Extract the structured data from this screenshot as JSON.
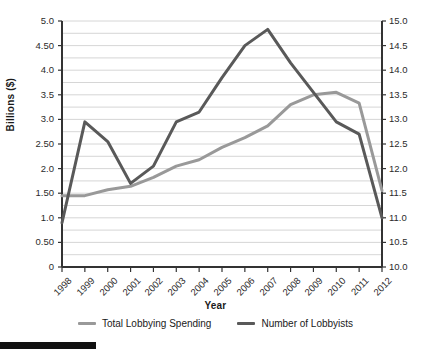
{
  "chart_data": {
    "type": "line",
    "title": "",
    "xlabel": "Year",
    "ylabel": "Billions ($)",
    "ylabel_secondary": "Number in Thousands",
    "categories": [
      "1998",
      "1999",
      "2000",
      "2001",
      "2002",
      "2003",
      "2004",
      "2005",
      "2006",
      "2007",
      "2008",
      "2009",
      "2010",
      "2011",
      "2012"
    ],
    "x": [
      1998,
      1999,
      2000,
      2001,
      2002,
      2003,
      2004,
      2005,
      2006,
      2007,
      2008,
      2009,
      2010,
      2011,
      2012
    ],
    "grid": true,
    "legend_position": "bottom",
    "ylim": [
      0,
      5.0
    ],
    "ylim_secondary": [
      10.0,
      15.0
    ],
    "yticks": [
      "0",
      "0.50",
      "1.0",
      "1.50",
      "2.0",
      "2.50",
      "3.0",
      "3.5",
      "4.0",
      "4.50",
      "5.0"
    ],
    "ytick_values": [
      0,
      0.5,
      1.0,
      1.5,
      2.0,
      2.5,
      3.0,
      3.5,
      4.0,
      4.5,
      5.0
    ],
    "yticks_secondary": [
      "10.0",
      "10.5",
      "11.0",
      "11.5",
      "12.0",
      "12.5",
      "13.0",
      "13.5",
      "14.0",
      "14.5",
      "15.0"
    ],
    "ytick_values_secondary": [
      10.0,
      10.5,
      11.0,
      11.5,
      12.0,
      12.5,
      13.0,
      13.5,
      14.0,
      14.5,
      15.0
    ],
    "gridline_step": 0.25,
    "series": [
      {
        "name": "Total Lobbying Spending",
        "axis": "left",
        "color": "#999999",
        "unit": "Billions ($)",
        "values": [
          1.45,
          1.45,
          1.57,
          1.64,
          1.82,
          2.05,
          2.18,
          2.43,
          2.63,
          2.87,
          3.3,
          3.5,
          3.55,
          3.33,
          1.55
        ]
      },
      {
        "name": "Number of Lobbyists",
        "axis": "right",
        "color": "#595959",
        "unit": "Number in Thousands",
        "values": [
          10.9,
          12.95,
          12.55,
          11.7,
          12.05,
          12.95,
          13.15,
          13.85,
          14.5,
          14.83,
          14.15,
          13.55,
          12.95,
          12.7,
          11.0
        ]
      }
    ]
  },
  "legend": {
    "items": [
      {
        "label": "Total Lobbying Spending",
        "color": "#999999"
      },
      {
        "label": "Number of Lobbyists",
        "color": "#595959"
      }
    ]
  },
  "colors": {
    "spending_line": "#999999",
    "lobbyists_line": "#595959",
    "gridline": "#cccccc",
    "axis": "#333333",
    "text": "#1a1a1a",
    "accent_bar": "#111111"
  }
}
